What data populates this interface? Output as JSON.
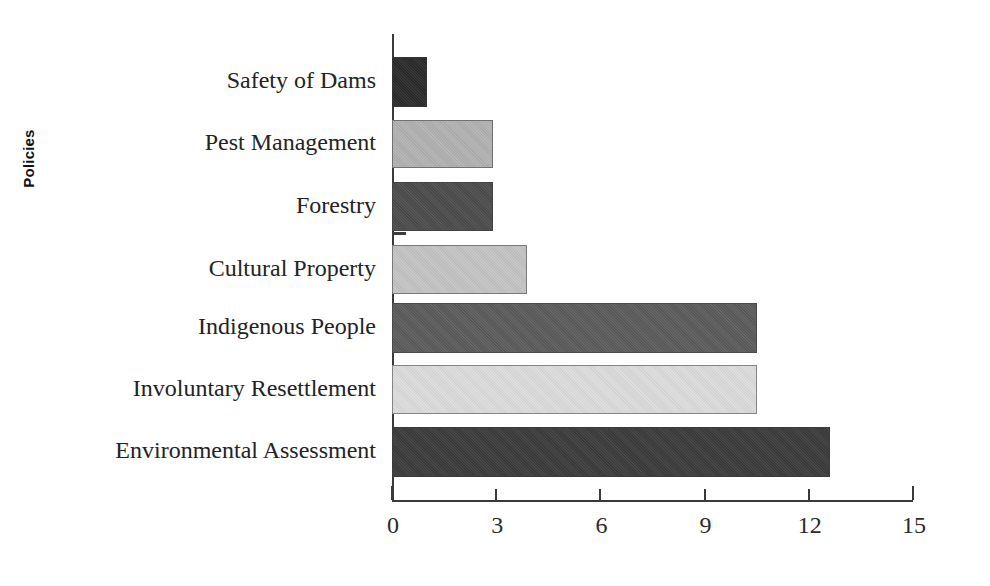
{
  "chart_data": {
    "type": "bar",
    "orientation": "horizontal",
    "title": "",
    "xlabel": "",
    "ylabel": "Policies",
    "xlim": [
      0,
      15
    ],
    "xticks": [
      0,
      3,
      6,
      9,
      12,
      15
    ],
    "xtick_labels": [
      "0",
      "3",
      "6",
      "9",
      "12",
      "15"
    ],
    "grid": false,
    "legend": false,
    "categories": [
      "Safety of Dams",
      "Pest Management",
      "Forestry",
      "Cultural Property",
      "Indigenous People",
      "Involuntary Resettlement",
      "Environmental Assessment"
    ],
    "values": [
      1.0,
      2.9,
      2.9,
      3.9,
      10.5,
      10.5,
      12.6
    ],
    "bar_colors": [
      "#2b2b2b",
      "#b2b2b2",
      "#4c4c4c",
      "#c4c4c4",
      "#5c5c5c",
      "#dcdcdc",
      "#3c3c3c"
    ],
    "bars": [
      {
        "label": "Safety of Dams",
        "value": 1.0,
        "color": "#2b2b2b"
      },
      {
        "label": "Pest Management",
        "value": 2.9,
        "color": "#b2b2b2"
      },
      {
        "label": "Forestry",
        "value": 2.9,
        "color": "#4c4c4c"
      },
      {
        "label": "Cultural Property",
        "value": 3.9,
        "color": "#c4c4c4"
      },
      {
        "label": "Indigenous People",
        "value": 10.5,
        "color": "#5c5c5c"
      },
      {
        "label": "Involuntary Resettlement",
        "value": 10.5,
        "color": "#dcdcdc"
      },
      {
        "label": "Environmental Assessment",
        "value": 12.6,
        "color": "#3c3c3c"
      }
    ]
  },
  "axis": {
    "y_title": "Policies",
    "tick_labels": [
      "0",
      "3",
      "6",
      "9",
      "12",
      "15"
    ]
  }
}
